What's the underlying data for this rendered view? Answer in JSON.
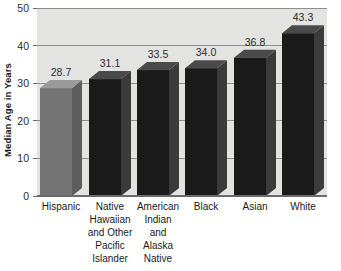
{
  "chart_data": {
    "type": "bar",
    "title": "",
    "subtitle": "",
    "xlabel": "",
    "ylabel": "Median Age in Years",
    "ylim": [
      0,
      50
    ],
    "yticks": [
      0,
      10,
      20,
      30,
      40,
      50
    ],
    "ytick_labels": [
      "0",
      "10",
      "20",
      "30",
      "40",
      "50"
    ],
    "grid": true,
    "legend": false,
    "legend_position": "none",
    "categories": [
      "Hispanic",
      "Native Hawaiian and Other Pacific Islander",
      "American Indian and Alaska Native",
      "Black",
      "Asian",
      "White"
    ],
    "category_lines": [
      [
        "Hispanic"
      ],
      [
        "Native",
        "Hawaiian",
        "and Other",
        "Pacific",
        "Islander"
      ],
      [
        "American",
        "Indian",
        "and",
        "Alaska",
        "Native"
      ],
      [
        "Black"
      ],
      [
        "Asian"
      ],
      [
        "White"
      ]
    ],
    "values": [
      28.7,
      31.1,
      33.5,
      34.0,
      36.8,
      43.3
    ],
    "value_labels": [
      "28.7",
      "31.1",
      "33.5",
      "34.0",
      "36.8",
      "43.3"
    ],
    "bar_colors": [
      "#737373",
      "#1a1a1a",
      "#1a1a1a",
      "#1a1a1a",
      "#1a1a1a",
      "#1a1a1a"
    ],
    "bar_top_colors": [
      "#9a9a9a",
      "#4a4a4a",
      "#4a4a4a",
      "#4a4a4a",
      "#4a4a4a",
      "#4a4a4a"
    ],
    "bar_side_colors": [
      "#5d5d5d",
      "#3b3b3b",
      "#3b3b3b",
      "#3b3b3b",
      "#3b3b3b",
      "#3b3b3b"
    ],
    "style": "3d-bar",
    "plot_background": "#e3e3e1",
    "grid_color": "#8e8e8e",
    "page_background": "#ffffff",
    "text_color": "#1a1a1a"
  }
}
